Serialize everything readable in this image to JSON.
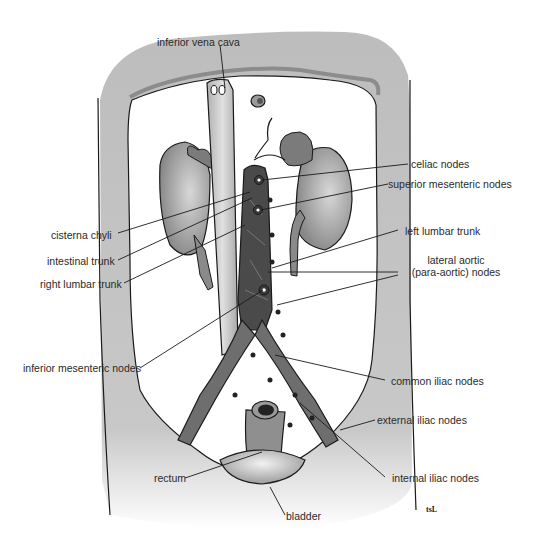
{
  "figure": {
    "colors": {
      "body_wall": "#bdbdbd",
      "cavity": "#ffffff",
      "organ": "#8f8f8f",
      "lymph_dark": "#4a4a4a",
      "lymph_mid": "#6e6e6e",
      "vena_cava": "#c4c4c4",
      "outline": "#1a1a1a",
      "label_text": "#2a2a2a"
    },
    "signature": "tsL"
  },
  "labels": {
    "inferior_vena_cava": "inferior vena cava",
    "celiac_nodes": "celiac nodes",
    "superior_mesenteric_nodes": "superior mesenteric nodes",
    "cisterna_chyli": "cisterna chyli",
    "intestinal_trunk": "intestinal trunk",
    "right_lumbar_trunk": "right lumbar trunk",
    "left_lumbar_trunk": "left lumbar trunk",
    "lateral_aortic_line1": "lateral aortic",
    "lateral_aortic_line2": "(para-aortic) nodes",
    "inferior_mesenteric_nodes": "inferior mesenteric nodes",
    "common_iliac_nodes": "common iliac nodes",
    "external_iliac_nodes": "external iliac nodes",
    "internal_iliac_nodes": "internal iliac nodes",
    "rectum": "rectum",
    "bladder": "bladder"
  }
}
